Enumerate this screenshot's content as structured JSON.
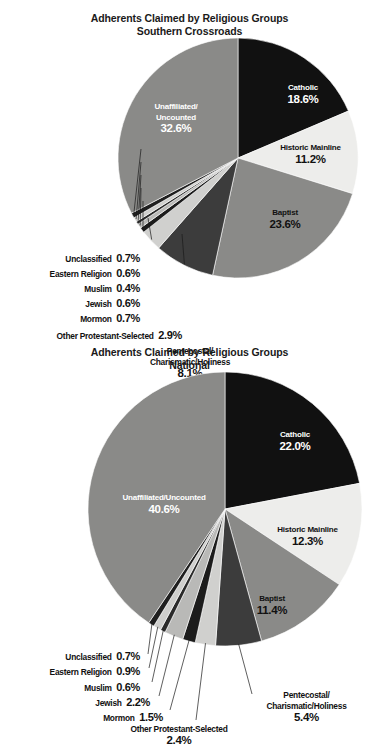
{
  "chart_data": [
    {
      "type": "pie",
      "title": "Adherents Claimed by Religious Groups",
      "subtitle": "Southern Crossroads",
      "legend": "none",
      "categories": [
        "Catholic",
        "Historic Mainline",
        "Baptist",
        "Pentecostal/Charismatic/Holiness",
        "Other Protestant-Selected",
        "Mormon",
        "Jewish",
        "Muslim",
        "Eastern Religion",
        "Unclassified",
        "Unaffiliated/Uncounted"
      ],
      "values": [
        18.6,
        11.2,
        23.6,
        8.1,
        2.9,
        0.7,
        0.6,
        0.4,
        0.6,
        0.7,
        32.6
      ],
      "value_labels": [
        "18.6%",
        "11.2%",
        "23.6%",
        "8.1%",
        "2.9%",
        "0.7%",
        "0.6%",
        "0.4%",
        "0.6%",
        "0.7%",
        "32.6%"
      ],
      "colors": [
        "#111111",
        "#ededeb",
        "#8a8a88",
        "#3c3c3c",
        "#d0d0ce",
        "#1c1c1c",
        "#b9b9b7",
        "#2a2a2a",
        "#cfcfcd",
        "#1f1f1f",
        "#8a8a88"
      ],
      "slices": [
        {
          "label": "Catholic",
          "value": 18.6,
          "value_label": "18.6%",
          "color": "#111111",
          "text": "light",
          "placement": "inside"
        },
        {
          "label": "Historic Mainline",
          "value": 11.2,
          "value_label": "11.2%",
          "color": "#ededeb",
          "text": "dark",
          "placement": "inside"
        },
        {
          "label": "Baptist",
          "value": 23.6,
          "value_label": "23.6%",
          "color": "#8a8a88",
          "text": "dark",
          "placement": "inside"
        },
        {
          "label": "Pentecostal/ Charismatic/Holiness",
          "value": 8.1,
          "value_label": "8.1%",
          "color": "#3c3c3c",
          "text": "dark",
          "placement": "outside"
        },
        {
          "label": "Other Protestant-Selected",
          "value": 2.9,
          "value_label": "2.9%",
          "color": "#d0d0ce",
          "text": "dark",
          "placement": "outside"
        },
        {
          "label": "Mormon",
          "value": 0.7,
          "value_label": "0.7%",
          "color": "#1c1c1c",
          "text": "dark",
          "placement": "outside"
        },
        {
          "label": "Jewish",
          "value": 0.6,
          "value_label": "0.6%",
          "color": "#b9b9b7",
          "text": "dark",
          "placement": "outside"
        },
        {
          "label": "Muslim",
          "value": 0.4,
          "value_label": "0.4%",
          "color": "#2a2a2a",
          "text": "dark",
          "placement": "outside"
        },
        {
          "label": "Eastern Religion",
          "value": 0.6,
          "value_label": "0.6%",
          "color": "#cfcfcd",
          "text": "dark",
          "placement": "outside"
        },
        {
          "label": "Unclassified",
          "value": 0.7,
          "value_label": "0.7%",
          "color": "#1f1f1f",
          "text": "dark",
          "placement": "outside"
        },
        {
          "label": "Unaffiliated/ Uncounted",
          "value": 32.6,
          "value_label": "32.6%",
          "color": "#8a8a88",
          "text": "light",
          "placement": "inside"
        }
      ]
    },
    {
      "type": "pie",
      "title": "Adherents Claimed by Religious Groups",
      "subtitle": "National",
      "legend": "none",
      "categories": [
        "Catholic",
        "Historic Mainline",
        "Baptist",
        "Pentecostal/Charismatic/Holiness",
        "Other Protestant-Selected",
        "Mormon",
        "Jewish",
        "Muslim",
        "Eastern Religion",
        "Unclassified",
        "Unaffiliated/Uncounted"
      ],
      "values": [
        22.0,
        12.3,
        11.4,
        5.4,
        2.4,
        1.5,
        2.2,
        0.6,
        0.9,
        0.7,
        40.6
      ],
      "value_labels": [
        "22.0%",
        "12.3%",
        "11.4%",
        "5.4%",
        "2.4%",
        "1.5%",
        "2.2%",
        "0.6%",
        "0.9%",
        "0.7%",
        "40.6%"
      ],
      "colors": [
        "#111111",
        "#ededeb",
        "#8a8a88",
        "#3c3c3c",
        "#d0d0ce",
        "#1c1c1c",
        "#b9b9b7",
        "#2a2a2a",
        "#cfcfcd",
        "#1f1f1f",
        "#8a8a88"
      ],
      "slices": [
        {
          "label": "Catholic",
          "value": 22.0,
          "value_label": "22.0%",
          "color": "#111111",
          "text": "light",
          "placement": "inside"
        },
        {
          "label": "Historic Mainline",
          "value": 12.3,
          "value_label": "12.3%",
          "color": "#ededeb",
          "text": "dark",
          "placement": "inside"
        },
        {
          "label": "Baptist",
          "value": 11.4,
          "value_label": "11.4%",
          "color": "#8a8a88",
          "text": "dark",
          "placement": "inside"
        },
        {
          "label": "Pentecostal/ Charismatic/Holiness",
          "value": 5.4,
          "value_label": "5.4%",
          "color": "#3c3c3c",
          "text": "dark",
          "placement": "outside"
        },
        {
          "label": "Other Protestant-Selected",
          "value": 2.4,
          "value_label": "2.4%",
          "color": "#d0d0ce",
          "text": "dark",
          "placement": "outside"
        },
        {
          "label": "Mormon",
          "value": 1.5,
          "value_label": "1.5%",
          "color": "#1c1c1c",
          "text": "dark",
          "placement": "outside"
        },
        {
          "label": "Jewish",
          "value": 2.2,
          "value_label": "2.2%",
          "color": "#b9b9b7",
          "text": "dark",
          "placement": "outside"
        },
        {
          "label": "Muslim",
          "value": 0.6,
          "value_label": "0.6%",
          "color": "#2a2a2a",
          "text": "dark",
          "placement": "outside"
        },
        {
          "label": "Eastern Religion",
          "value": 0.9,
          "value_label": "0.9%",
          "color": "#cfcfcd",
          "text": "dark",
          "placement": "outside"
        },
        {
          "label": "Unclassified",
          "value": 0.7,
          "value_label": "0.7%",
          "color": "#1f1f1f",
          "text": "dark",
          "placement": "outside"
        },
        {
          "label": "Unaffiliated/Uncounted",
          "value": 40.6,
          "value_label": "40.6%",
          "color": "#8a8a88",
          "text": "light",
          "placement": "inside"
        }
      ]
    }
  ],
  "chart1": {
    "title_line1": "Adherents Claimed by Religious Groups",
    "title_line2": "Southern Crossroads",
    "catholic_name": "Catholic",
    "catholic_pct": "18.6%",
    "mainline_name": "Historic Mainline",
    "mainline_pct": "11.2%",
    "baptist_name": "Baptist",
    "baptist_pct": "23.6%",
    "unaff_name1": "Unaffiliated/",
    "unaff_name2": "Uncounted",
    "unaff_pct": "32.6%",
    "pent_name1": "Pentecostal/",
    "pent_name2": "Charismatic/Holiness",
    "pent_pct": "8.1%",
    "otherprot_name": "Other Protestant-Selected",
    "otherprot_pct": "2.9%",
    "mormon_name": "Mormon",
    "mormon_pct": "0.7%",
    "jewish_name": "Jewish",
    "jewish_pct": "0.6%",
    "muslim_name": "Muslim",
    "muslim_pct": "0.4%",
    "eastern_name": "Eastern Religion",
    "eastern_pct": "0.6%",
    "unclass_name": "Unclassified",
    "unclass_pct": "0.7%"
  },
  "chart2": {
    "title_line1": "Adherents Claimed by Religious Groups",
    "title_line2": "National",
    "catholic_name": "Catholic",
    "catholic_pct": "22.0%",
    "mainline_name": "Historic Mainline",
    "mainline_pct": "12.3%",
    "baptist_name": "Baptist",
    "baptist_pct": "11.4%",
    "unaff_name1": "Unaffiliated/Uncounted",
    "unaff_pct": "40.6%",
    "pent_name1": "Pentecostal/",
    "pent_name2": "Charismatic/Holiness",
    "pent_pct": "5.4%",
    "otherprot_name": "Other Protestant-Selected",
    "otherprot_pct": "2.4%",
    "mormon_name": "Mormon",
    "mormon_pct": "1.5%",
    "jewish_name": "Jewish",
    "jewish_pct": "2.2%",
    "muslim_name": "Muslim",
    "muslim_pct": "0.6%",
    "eastern_name": "Eastern Religion",
    "eastern_pct": "0.9%",
    "unclass_name": "Unclassified",
    "unclass_pct": "0.7%"
  }
}
